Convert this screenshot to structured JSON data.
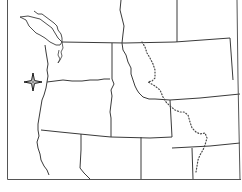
{
  "map": {
    "title": "",
    "region": "Pacific Northwest, United States",
    "style": "outline",
    "colors": {
      "background": "#ffffff",
      "border_line": "#3a3a3a",
      "divide_dotted": "#4a4a4a"
    },
    "features": [
      {
        "type": "state-border",
        "name": "washington"
      },
      {
        "type": "state-border",
        "name": "oregon"
      },
      {
        "type": "state-border",
        "name": "idaho"
      },
      {
        "type": "state-border",
        "name": "montana"
      },
      {
        "type": "state-border",
        "name": "wyoming"
      },
      {
        "type": "state-border",
        "name": "nevada"
      },
      {
        "type": "state-border",
        "name": "california"
      },
      {
        "type": "state-border",
        "name": "utah"
      },
      {
        "type": "international-border",
        "name": "canada-us-border"
      },
      {
        "type": "dotted-line",
        "name": "continental-divide"
      },
      {
        "type": "marker",
        "name": "location-star",
        "shape": "four-point-star"
      }
    ],
    "labels": []
  }
}
